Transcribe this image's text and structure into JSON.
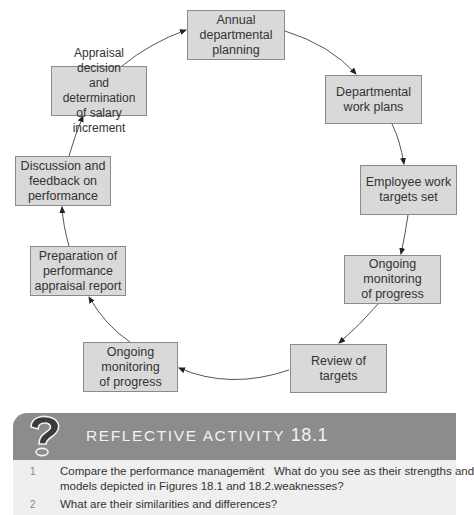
{
  "diagram": {
    "type": "cycle",
    "nodes": [
      {
        "id": "annual",
        "label": "Annual departmental planning",
        "lines": [
          "Annual",
          "departmental",
          "planning"
        ]
      },
      {
        "id": "dept_work_plans",
        "label": "Departmental work plans",
        "lines": [
          "Departmental",
          "work plans"
        ]
      },
      {
        "id": "employee_targets",
        "label": "Employee work targets set",
        "lines": [
          "Employee work",
          "targets set"
        ]
      },
      {
        "id": "monitoring_right",
        "label": "Ongoing monitoring of progress",
        "lines": [
          "Ongoing monitoring",
          "of progress"
        ]
      },
      {
        "id": "review",
        "label": "Review of targets",
        "lines": [
          "Review of",
          "targets"
        ]
      },
      {
        "id": "monitoring_left",
        "label": "Ongoing monitoring of progress",
        "lines": [
          "Ongoing monitoring",
          "of progress"
        ]
      },
      {
        "id": "preparation",
        "label": "Preparation of performance appraisal report",
        "lines": [
          "Preparation of",
          "performance",
          "appraisal report"
        ]
      },
      {
        "id": "discussion",
        "label": "Discussion and feedback on performance",
        "lines": [
          "Discussion and",
          "feedback on",
          "performance"
        ]
      },
      {
        "id": "appraisal",
        "label": "Appraisal decision and determination of salary increment",
        "lines": [
          "Appraisal decision",
          "and determination",
          "of salary increment"
        ]
      }
    ],
    "edges": [
      [
        "annual",
        "dept_work_plans"
      ],
      [
        "dept_work_plans",
        "employee_targets"
      ],
      [
        "employee_targets",
        "monitoring_right"
      ],
      [
        "monitoring_right",
        "review"
      ],
      [
        "review",
        "monitoring_left"
      ],
      [
        "monitoring_left",
        "preparation"
      ],
      [
        "preparation",
        "discussion"
      ],
      [
        "discussion",
        "appraisal"
      ],
      [
        "appraisal",
        "annual"
      ]
    ],
    "colors": {
      "box_fill": "#d9d9d9",
      "box_border": "#8a8a8a",
      "arrow": "#333333"
    }
  },
  "activity": {
    "icon": "question-mark-icon",
    "title": "REFLECTIVE ACTIVITY",
    "number": "18.1",
    "banner_color": "#8c8c8c",
    "panel_color": "#efefef",
    "questions": [
      {
        "num": "1",
        "text_lines": [
          "Compare the performance management",
          "models depicted in Figures 18.1 and 18.2."
        ]
      },
      {
        "num": "2",
        "text_lines": [
          "What are their similarities and differences?"
        ]
      },
      {
        "num": "3",
        "text_lines": [
          "What do you see as their strengths and",
          "weaknesses?"
        ]
      }
    ]
  }
}
